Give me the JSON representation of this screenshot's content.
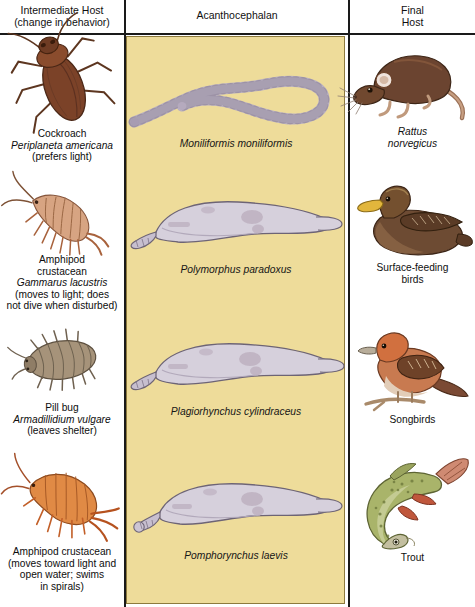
{
  "figure": {
    "panel_color": "#eedc9a",
    "headers": {
      "left_line1": "Intermediate Host",
      "left_line2": "(change in behavior)",
      "middle": "Acanthocephalan",
      "right_line1": "Final",
      "right_line2": "Host"
    }
  },
  "rows": [
    {
      "host": {
        "common_name": "Cockroach",
        "species": "Periplaneta americana",
        "behavior": "(prefers light)",
        "icon": "cockroach-illustration",
        "color": "#7b4228"
      },
      "parasite": {
        "species": "Moniliformis moniliformis",
        "icon": "moniliformis-worm-illustration",
        "color": "#cfc6d4"
      },
      "final_host": {
        "label_line1": "Rattus",
        "label_line2": "norvegicus",
        "italic": true,
        "icon": "rat-illustration",
        "color": "#6b4430"
      }
    },
    {
      "host": {
        "common_name_line1": "Amphipod",
        "common_name_line2": "crustacean",
        "species": "Gammarus lacustris",
        "behavior_line1": "(moves to light; does",
        "behavior_line2": "not dive when disturbed)",
        "icon": "amphipod-gammarus-illustration",
        "color": "#c08a6a"
      },
      "parasite": {
        "species": "Polymorphus paradoxus",
        "icon": "polymorphus-worm-illustration",
        "color": "#d6d0dc"
      },
      "final_host": {
        "label_line1": "Surface-feeding",
        "label_line2": "birds",
        "italic": false,
        "icon": "duck-illustration",
        "color": "#6d4b33"
      }
    },
    {
      "host": {
        "common_name": "Pill bug",
        "species": "Armadillidium vulgare",
        "behavior": "(leaves shelter)",
        "icon": "pillbug-illustration",
        "color": "#9a8a74"
      },
      "parasite": {
        "species": "Plagiorhynchus cylindraceus",
        "icon": "plagiorhynchus-worm-illustration",
        "color": "#d6d0dc"
      },
      "final_host": {
        "label_line1": "Songbirds",
        "label_line2": "",
        "italic": false,
        "icon": "songbird-illustration",
        "color": "#c05a32"
      }
    },
    {
      "host": {
        "common_name_line1": "Amphipod crustacean",
        "behavior_line1": "(moves toward light and",
        "behavior_line2": "open water; swims",
        "behavior_line3": "in spirals)",
        "icon": "amphipod-illustration",
        "color": "#d8763a"
      },
      "parasite": {
        "species": "Pomphorynchus laevis",
        "icon": "pomphorynchus-worm-illustration",
        "color": "#d6d0dc"
      },
      "final_host": {
        "label_line1": "Trout",
        "label_line2": "",
        "italic": false,
        "icon": "trout-illustration",
        "color": "#a9b46a"
      }
    }
  ]
}
